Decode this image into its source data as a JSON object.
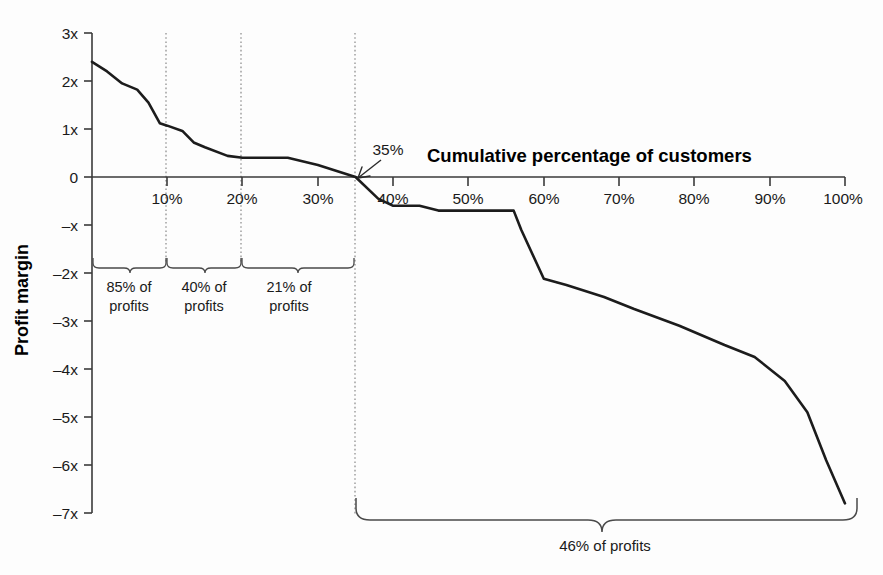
{
  "chart_data": {
    "type": "line",
    "title": "Cumulative percentage of customers",
    "xlabel": "Cumulative percentage of customers",
    "ylabel": "Profit margin",
    "xlim": [
      0,
      100
    ],
    "ylim": [
      -7,
      3
    ],
    "grid": false,
    "legend": null,
    "x_tick_labels": [
      "10%",
      "20%",
      "30%",
      "40%",
      "50%",
      "60%",
      "70%",
      "80%",
      "90%",
      "100%"
    ],
    "x_tick_values": [
      10,
      20,
      30,
      40,
      50,
      60,
      70,
      80,
      90,
      100
    ],
    "y_tick_labels": [
      "3x",
      "2x",
      "1x",
      "0",
      "–x",
      "–2x",
      "–3x",
      "–4x",
      "–5x",
      "–6x",
      "–7x"
    ],
    "y_tick_values": [
      3,
      2,
      1,
      0,
      -1,
      -2,
      -3,
      -4,
      -5,
      -6,
      -7
    ],
    "series": [
      {
        "name": "Profit margin by cumulative customer percentage",
        "x": [
          0,
          2,
          4,
          6,
          7.5,
          9,
          10,
          12,
          13.5,
          15,
          18,
          20,
          26,
          30,
          35,
          38,
          40,
          43.5,
          46,
          48,
          52,
          56,
          57,
          60,
          63,
          68,
          72,
          78,
          84,
          88,
          92,
          95,
          97.5,
          100
        ],
        "y": [
          2.4,
          2.2,
          1.95,
          1.82,
          1.55,
          1.12,
          1.07,
          0.96,
          0.72,
          0.62,
          0.44,
          0.4,
          0.4,
          0.25,
          0.0,
          -0.45,
          -0.6,
          -0.6,
          -0.7,
          -0.7,
          -0.7,
          -0.7,
          -1.1,
          -2.12,
          -2.25,
          -2.5,
          -2.75,
          -3.1,
          -3.5,
          -3.75,
          -4.25,
          -4.9,
          -5.9,
          -6.8
        ]
      }
    ],
    "annotations": [
      {
        "name": "crossing-35",
        "label": "35%",
        "x": 35,
        "y": 0,
        "note": "curve crosses zero profit margin"
      }
    ],
    "guides": [
      {
        "name": "guide-10",
        "x": 10
      },
      {
        "name": "guide-20",
        "x": 20
      },
      {
        "name": "guide-35",
        "x": 35
      }
    ],
    "braces": [
      {
        "name": "brace-0-10",
        "from_x": 0,
        "to_x": 10,
        "label_line1": "85% of",
        "label_line2": "profits"
      },
      {
        "name": "brace-10-20",
        "from_x": 10,
        "to_x": 20,
        "label_line1": "40% of",
        "label_line2": "profits"
      },
      {
        "name": "brace-20-35",
        "from_x": 20,
        "to_x": 35,
        "label_line1": "21% of",
        "label_line2": "profits"
      },
      {
        "name": "brace-35-100",
        "from_x": 35,
        "to_x": 100,
        "label_line1": "46% of profits",
        "label_line2": ""
      }
    ],
    "colors": {
      "curve": "#1c1c1c",
      "axis": "#3a3a3a",
      "guide": "#888888",
      "brace": "#4a4a4a",
      "text": "#1a1a1a",
      "background": "#fdfdfd"
    }
  }
}
